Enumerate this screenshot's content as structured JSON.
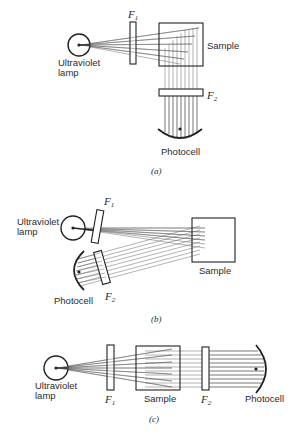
{
  "figure": {
    "panels": [
      {
        "id": "a",
        "caption": "(a)",
        "labels": {
          "lamp_line1": "Ultraviolet",
          "lamp_line2": "lamp",
          "filter1": "F",
          "filter1_sub": "1",
          "sample": "Sample",
          "filter2": "F",
          "filter2_sub": "2",
          "photocell": "Photocell"
        },
        "arrangement": "right-angle (photocell at 90° below sample)"
      },
      {
        "id": "b",
        "caption": "(b)",
        "labels": {
          "lamp_line1": "Ultraviolet",
          "lamp_line2": "lamp",
          "filter1": "F",
          "filter1_sub": "1",
          "sample": "Sample",
          "filter2": "F",
          "filter2_sub": "2",
          "photocell": "Photocell"
        },
        "arrangement": "front-surface (photocell on same side as lamp)"
      },
      {
        "id": "c",
        "caption": "(c)",
        "labels": {
          "lamp_line1": "Ultraviolet",
          "lamp_line2": "lamp",
          "filter1": "F",
          "filter1_sub": "1",
          "sample": "Sample",
          "filter2": "F",
          "filter2_sub": "2",
          "photocell": "Photocell"
        },
        "arrangement": "in-line (straight-through)"
      }
    ],
    "colors": {
      "line": "#222222",
      "ray": "#555555",
      "background": "#ffffff"
    }
  }
}
